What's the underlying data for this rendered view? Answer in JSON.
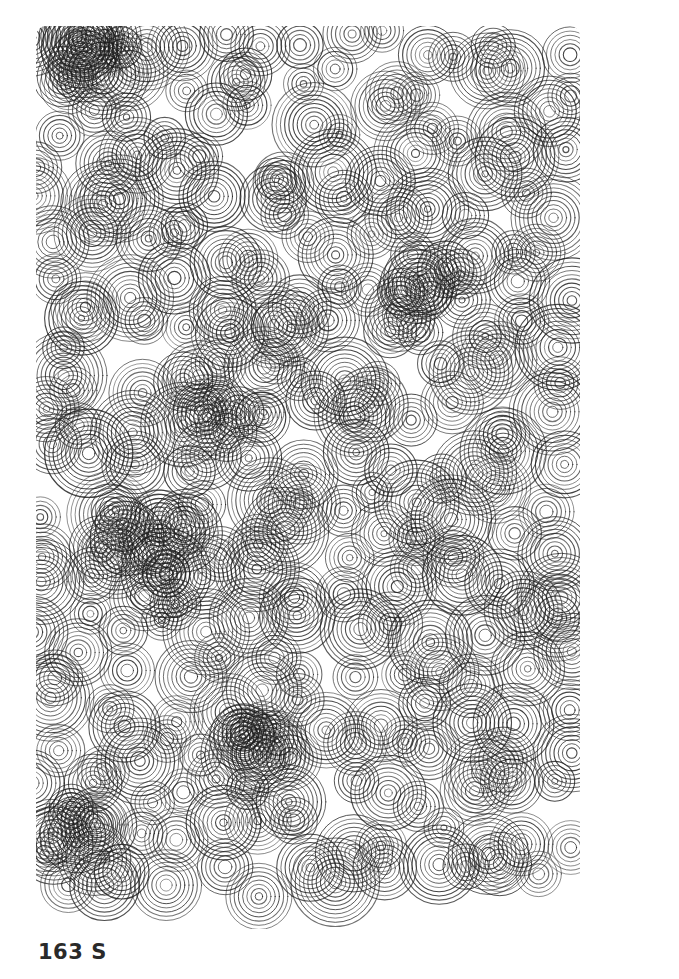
{
  "caption": "163 S",
  "artwork": {
    "description": "Plotter drawing of overlapping concentric circles filling a rectangle",
    "region": {
      "x": 40,
      "y": 30,
      "width": 535,
      "height": 895
    },
    "stroke_color": "#1e1e1e",
    "background": "#ffffff",
    "ring_spacing": 4.2,
    "rings_per_circle": [
      5,
      10
    ],
    "grid_step": 42,
    "dense_clusters": [
      {
        "x": 90,
        "y": 70
      },
      {
        "x": 150,
        "y": 540
      },
      {
        "x": 430,
        "y": 290
      },
      {
        "x": 250,
        "y": 720
      },
      {
        "x": 230,
        "y": 400
      },
      {
        "x": 80,
        "y": 830
      }
    ]
  }
}
